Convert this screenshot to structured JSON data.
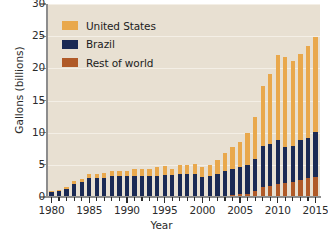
{
  "chart_data": {
    "type": "bar",
    "subtype": "stacked-vertical",
    "title": "",
    "xlabel": "Year",
    "ylabel": "Gallons (billions)",
    "ylim": [
      0,
      30
    ],
    "y_ticks": [
      0,
      5,
      10,
      15,
      20,
      25,
      30
    ],
    "y_tick_labels": [
      "0",
      "5",
      "10",
      "15",
      "20",
      "25",
      "30"
    ],
    "xlim": [
      1979.4,
      2015.6
    ],
    "x_ticks": [
      1980,
      1985,
      1990,
      1995,
      2000,
      2005,
      2010,
      2015
    ],
    "x_tick_labels": [
      "1980",
      "1985",
      "1990",
      "1995",
      "2000",
      "2005",
      "2010",
      "2015"
    ],
    "grid": "horizontal",
    "legend_position": "upper-left-inside",
    "plot_background": "#e8e0d2",
    "categories": [
      1980,
      1981,
      1982,
      1983,
      1984,
      1985,
      1986,
      1987,
      1988,
      1989,
      1990,
      1991,
      1992,
      1993,
      1994,
      1995,
      1996,
      1997,
      1998,
      1999,
      2000,
      2001,
      2002,
      2003,
      2004,
      2005,
      2006,
      2007,
      2008,
      2009,
      2010,
      2011,
      2012,
      2013,
      2014,
      2015
    ],
    "series": [
      {
        "name": "Rest of world",
        "color": "#b05a28",
        "values": [
          0.0,
          0.0,
          0.0,
          0.0,
          0.0,
          0.0,
          0.0,
          0.0,
          0.0,
          0.0,
          0.0,
          0.0,
          0.0,
          0.0,
          0.0,
          0.0,
          0.0,
          0.0,
          0.0,
          0.0,
          0.0,
          0.1,
          0.1,
          0.2,
          0.3,
          0.4,
          0.5,
          0.9,
          1.5,
          1.7,
          2.0,
          2.2,
          2.4,
          2.6,
          2.9,
          3.1
        ]
      },
      {
        "name": "Brazil",
        "color": "#1b2a54",
        "values": [
          0.8,
          1.0,
          1.3,
          2.1,
          2.4,
          2.9,
          2.9,
          3.0,
          3.2,
          3.2,
          3.2,
          3.3,
          3.2,
          3.2,
          3.3,
          3.4,
          3.4,
          3.6,
          3.6,
          3.6,
          3.1,
          3.1,
          3.5,
          3.8,
          4.0,
          4.2,
          4.5,
          5.0,
          6.5,
          6.6,
          6.9,
          5.6,
          5.6,
          6.3,
          6.2,
          7.0
        ]
      },
      {
        "name": "United States",
        "color": "#e9a84c",
        "values": [
          0.1,
          0.1,
          0.2,
          0.4,
          0.4,
          0.6,
          0.7,
          0.8,
          0.8,
          0.9,
          0.9,
          1.0,
          1.1,
          1.2,
          1.3,
          1.4,
          1.0,
          1.3,
          1.4,
          1.5,
          1.6,
          1.8,
          2.1,
          2.8,
          3.4,
          3.9,
          4.9,
          6.5,
          9.2,
          10.8,
          13.2,
          13.9,
          13.2,
          13.3,
          14.3,
          14.8
        ]
      }
    ]
  },
  "legend": {
    "items": [
      {
        "label": "United States",
        "color": "#e9a84c"
      },
      {
        "label": "Brazil",
        "color": "#1b2a54"
      },
      {
        "label": "Rest of world",
        "color": "#b05a28"
      }
    ]
  }
}
